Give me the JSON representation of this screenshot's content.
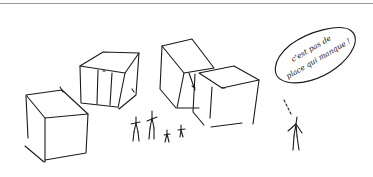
{
  "illustration": {
    "type": "hand-drawn sketch",
    "speech_bubble": {
      "line1": "c'est pas de",
      "line2": "place qui manque !"
    },
    "elements": [
      "cube",
      "cube",
      "cube",
      "cube",
      "stick-figure",
      "stick-figure",
      "stick-figure",
      "stick-figure",
      "stick-figure"
    ],
    "colors": {
      "ink": "#1a1a1a",
      "rule": "#9a9a9a",
      "background": "#ffffff"
    }
  }
}
